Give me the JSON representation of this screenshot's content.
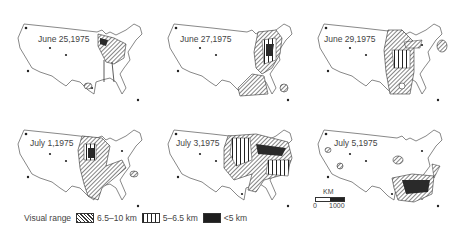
{
  "figure": {
    "panels": [
      {
        "date": "June 25,1975"
      },
      {
        "date": "June 27,1975"
      },
      {
        "date": "June 29,1975"
      },
      {
        "date": "July 1,1975"
      },
      {
        "date": "July 3,1975"
      },
      {
        "date": "July 5,1975"
      }
    ],
    "legend": {
      "title": "Visual range",
      "items": [
        {
          "label": "6.5–10 km",
          "pattern": "diagonal-hatch"
        },
        {
          "label": "5–6.5 km",
          "pattern": "vertical-stripes"
        },
        {
          "label": "<5 km",
          "pattern": "solid-dark"
        }
      ]
    },
    "scale_bar": {
      "unit": "KM",
      "start": "0",
      "end": "1000"
    }
  }
}
